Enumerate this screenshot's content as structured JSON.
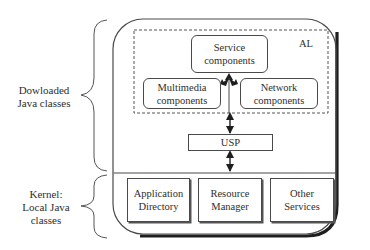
{
  "diagram": {
    "left_labels": {
      "downloaded": {
        "line1": "Dowloaded",
        "line2": "Java classes"
      },
      "kernel": {
        "line1": "Kernel:",
        "line2": "Local Java",
        "line3": "classes"
      }
    },
    "al_label": "AL",
    "boxes": {
      "service": {
        "line1": "Service",
        "line2": "components"
      },
      "multimedia": {
        "line1": "Multimedia",
        "line2": "components"
      },
      "network": {
        "line1": "Network",
        "line2": "components"
      },
      "usp": {
        "line1": "USP"
      },
      "app_directory": {
        "line1": "Application",
        "line2": "Directory"
      },
      "resource_manager": {
        "line1": "Resource",
        "line2": "Manager"
      },
      "other_services": {
        "line1": "Other",
        "line2": "Services"
      }
    },
    "colors": {
      "line": "#4a4a4a",
      "shadow": "#222222",
      "background": "#ffffff"
    }
  }
}
